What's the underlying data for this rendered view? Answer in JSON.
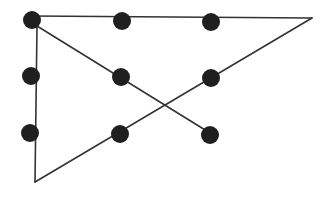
{
  "diagram": {
    "background": "#ffffff",
    "dot_color": "#1f1f1f",
    "line_color": "#333333",
    "dot_radius": 9,
    "dots": [
      {
        "row": 1,
        "col": 1,
        "x": 32,
        "y": 20
      },
      {
        "row": 1,
        "col": 2,
        "x": 122,
        "y": 21
      },
      {
        "row": 1,
        "col": 3,
        "x": 211,
        "y": 22
      },
      {
        "row": 2,
        "col": 1,
        "x": 31,
        "y": 76
      },
      {
        "row": 2,
        "col": 2,
        "x": 121,
        "y": 77
      },
      {
        "row": 2,
        "col": 3,
        "x": 211,
        "y": 78
      },
      {
        "row": 3,
        "col": 1,
        "x": 30,
        "y": 133
      },
      {
        "row": 3,
        "col": 2,
        "x": 120,
        "y": 134
      },
      {
        "row": 3,
        "col": 3,
        "x": 210,
        "y": 135
      }
    ],
    "path": [
      {
        "x": 32,
        "y": 16
      },
      {
        "x": 312,
        "y": 18
      },
      {
        "x": 35,
        "y": 182
      },
      {
        "x": 37,
        "y": 26
      },
      {
        "x": 210,
        "y": 133
      }
    ]
  }
}
